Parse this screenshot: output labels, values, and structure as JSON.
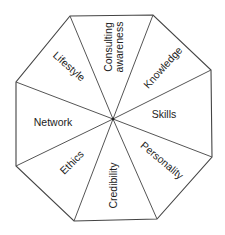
{
  "diagram": {
    "shape": "octagon",
    "center": [
      113,
      119
    ],
    "vertices": [
      [
        70,
        16
      ],
      [
        153,
        15
      ],
      [
        211,
        70
      ],
      [
        212,
        157
      ],
      [
        157,
        219
      ],
      [
        74,
        221
      ],
      [
        16,
        166
      ],
      [
        16,
        82
      ]
    ],
    "colors": {
      "line": "#555555",
      "text": "#222222",
      "background": "#ffffff"
    },
    "segments": [
      {
        "id": "consulting-awareness",
        "lines": [
          "Consulting",
          "awareness"
        ]
      },
      {
        "id": "knowledge",
        "lines": [
          "Knowledge"
        ]
      },
      {
        "id": "skills",
        "lines": [
          "Skills"
        ]
      },
      {
        "id": "personality",
        "lines": [
          "Personality"
        ]
      },
      {
        "id": "credibility",
        "lines": [
          "Credibility"
        ]
      },
      {
        "id": "ethics",
        "lines": [
          "Ethics"
        ]
      },
      {
        "id": "network",
        "lines": [
          "Network"
        ]
      },
      {
        "id": "lifestyle",
        "lines": [
          "Lifestyle"
        ]
      }
    ]
  }
}
